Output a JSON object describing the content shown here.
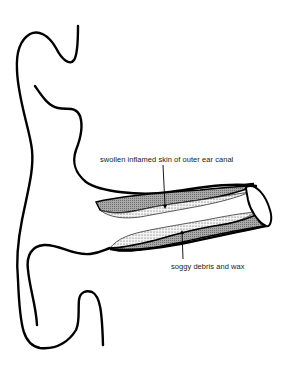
{
  "diagram": {
    "labels": {
      "top": "swollen inflamed skin of outer ear canal",
      "bottom": "soggy debris and wax"
    },
    "colors": {
      "outline": "#000000",
      "skin_fill": "#9a9a9a",
      "debris_fill": "#f2f2f2",
      "background": "#ffffff"
    }
  }
}
